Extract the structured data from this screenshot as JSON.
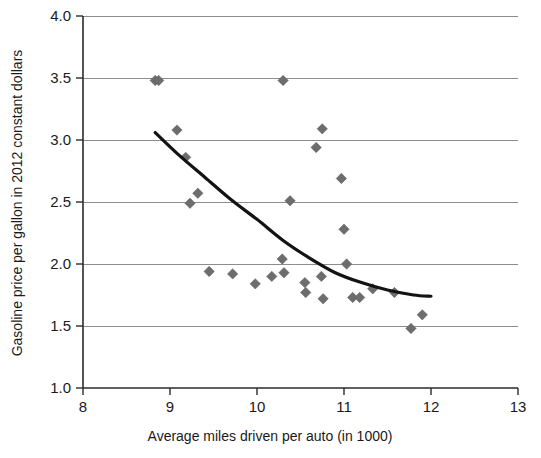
{
  "chart_data": {
    "type": "scatter",
    "title": "",
    "subtitle": "",
    "xlabel": "Average miles driven per auto (in 1000)",
    "ylabel": "Gasoline price per gallon in 2012 constant dollars",
    "xlim": [
      8,
      13
    ],
    "ylim": [
      1.0,
      4.0
    ],
    "xticks": [
      "8",
      "9",
      "10",
      "11",
      "12",
      "13"
    ],
    "xtick_values": [
      8,
      9,
      10,
      11,
      12,
      13
    ],
    "yticks": [
      "1.0",
      "1.5",
      "2.0",
      "2.5",
      "3.0",
      "3.5",
      "4.0"
    ],
    "ytick_values": [
      1.0,
      1.5,
      2.0,
      2.5,
      3.0,
      3.5,
      4.0
    ],
    "grid": "horizontal",
    "legend": "none",
    "marker_shape": "diamond",
    "marker_color": "#6d6d6d",
    "curve_color": "#131313",
    "series": [
      {
        "name": "Gasoline price vs miles driven",
        "points": [
          [
            8.83,
            3.48
          ],
          [
            8.87,
            3.48
          ],
          [
            9.08,
            3.08
          ],
          [
            9.18,
            2.86
          ],
          [
            9.23,
            2.49
          ],
          [
            9.32,
            2.57
          ],
          [
            9.45,
            1.94
          ],
          [
            9.72,
            1.92
          ],
          [
            9.98,
            1.84
          ],
          [
            10.17,
            1.9
          ],
          [
            10.29,
            2.04
          ],
          [
            10.3,
            3.48
          ],
          [
            10.31,
            1.93
          ],
          [
            10.38,
            2.51
          ],
          [
            10.55,
            1.85
          ],
          [
            10.56,
            1.77
          ],
          [
            10.68,
            2.94
          ],
          [
            10.74,
            1.9
          ],
          [
            10.75,
            3.09
          ],
          [
            10.76,
            1.72
          ],
          [
            10.97,
            2.69
          ],
          [
            11.0,
            2.28
          ],
          [
            11.03,
            2.0
          ],
          [
            11.1,
            1.73
          ],
          [
            11.18,
            1.73
          ],
          [
            11.33,
            1.8
          ],
          [
            11.58,
            1.77
          ],
          [
            11.77,
            1.48
          ],
          [
            11.9,
            1.59
          ]
        ]
      }
    ],
    "trend_curve": {
      "name": "fitted trend",
      "points": [
        [
          8.83,
          3.06
        ],
        [
          9.1,
          2.88
        ],
        [
          9.4,
          2.7
        ],
        [
          9.7,
          2.52
        ],
        [
          10.0,
          2.36
        ],
        [
          10.3,
          2.19
        ],
        [
          10.6,
          2.05
        ],
        [
          10.9,
          1.93
        ],
        [
          11.2,
          1.85
        ],
        [
          11.5,
          1.79
        ],
        [
          11.8,
          1.75
        ],
        [
          12.0,
          1.74
        ]
      ]
    }
  }
}
